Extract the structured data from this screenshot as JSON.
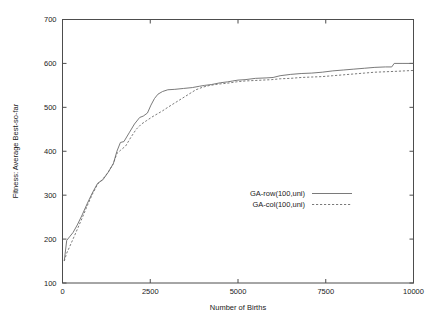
{
  "chart_data": {
    "type": "line",
    "title": "",
    "xlabel": "Number of Births",
    "ylabel": "Fitness: Average Best-so-far",
    "xlim": [
      0,
      10000
    ],
    "ylim": [
      100,
      700
    ],
    "grid": false,
    "legend_position": "center-right",
    "xticks": [
      0,
      2500,
      5000,
      7500,
      10000
    ],
    "xtick_labels": [
      "0",
      "2500",
      "5000",
      "7500",
      "10000"
    ],
    "yticks": [
      100,
      200,
      300,
      400,
      500,
      600,
      700
    ],
    "ytick_labels": [
      "100",
      "200",
      "300",
      "400",
      "500",
      "600",
      "700"
    ],
    "series": [
      {
        "name": "GA-row(100,uni)",
        "style": "solid",
        "color": "#6b6b6b",
        "x": [
          50,
          120,
          200,
          300,
          420,
          560,
          700,
          850,
          1000,
          1150,
          1300,
          1450,
          1550,
          1650,
          1750,
          1900,
          2050,
          2200,
          2300,
          2420,
          2520,
          2620,
          2720,
          2850,
          3000,
          3200,
          3450,
          3700,
          3900,
          4050,
          4250,
          4500,
          4700,
          4850,
          5000,
          5200,
          5500,
          5800,
          6000,
          6200,
          6500,
          6800,
          7100,
          7400,
          7700,
          8000,
          8300,
          8600,
          8900,
          9200,
          9380,
          9450,
          9700,
          10000
        ],
        "y": [
          150,
          197,
          205,
          215,
          232,
          255,
          280,
          305,
          327,
          335,
          352,
          372,
          400,
          420,
          422,
          442,
          462,
          477,
          480,
          487,
          505,
          520,
          530,
          536,
          540,
          541,
          543,
          545,
          548,
          550,
          552,
          556,
          558,
          560,
          562,
          563,
          566,
          567,
          568,
          572,
          575,
          577,
          578,
          580,
          583,
          585,
          587,
          589,
          591,
          592,
          592,
          600,
          600,
          600
        ]
      },
      {
        "name": "GA-col(100,uni)",
        "style": "dashed",
        "color": "#6b6b6b",
        "x": [
          50,
          120,
          200,
          300,
          420,
          560,
          700,
          850,
          1000,
          1150,
          1300,
          1450,
          1550,
          1650,
          1800,
          1950,
          2100,
          2250,
          2400,
          2550,
          2700,
          2850,
          3000,
          3200,
          3400,
          3600,
          3800,
          4000,
          4200,
          4450,
          4700,
          4950,
          5200,
          5450,
          5700,
          5950,
          6200,
          6500,
          6800,
          7100,
          7400,
          7700,
          8000,
          8300,
          8600,
          8900,
          9200,
          9500,
          9750,
          10000
        ],
        "y": [
          150,
          168,
          182,
          200,
          222,
          248,
          275,
          302,
          325,
          337,
          352,
          372,
          395,
          402,
          412,
          432,
          450,
          462,
          470,
          478,
          485,
          492,
          500,
          510,
          520,
          530,
          540,
          546,
          550,
          553,
          555,
          558,
          560,
          561,
          562,
          563,
          565,
          566,
          568,
          569,
          570,
          572,
          574,
          576,
          578,
          580,
          581,
          582,
          583,
          584
        ]
      }
    ]
  },
  "legend": {
    "entries": [
      {
        "label": "GA-row(100,uni)",
        "style": "solid"
      },
      {
        "label": "GA-col(100,uni)",
        "style": "dashed"
      }
    ]
  }
}
